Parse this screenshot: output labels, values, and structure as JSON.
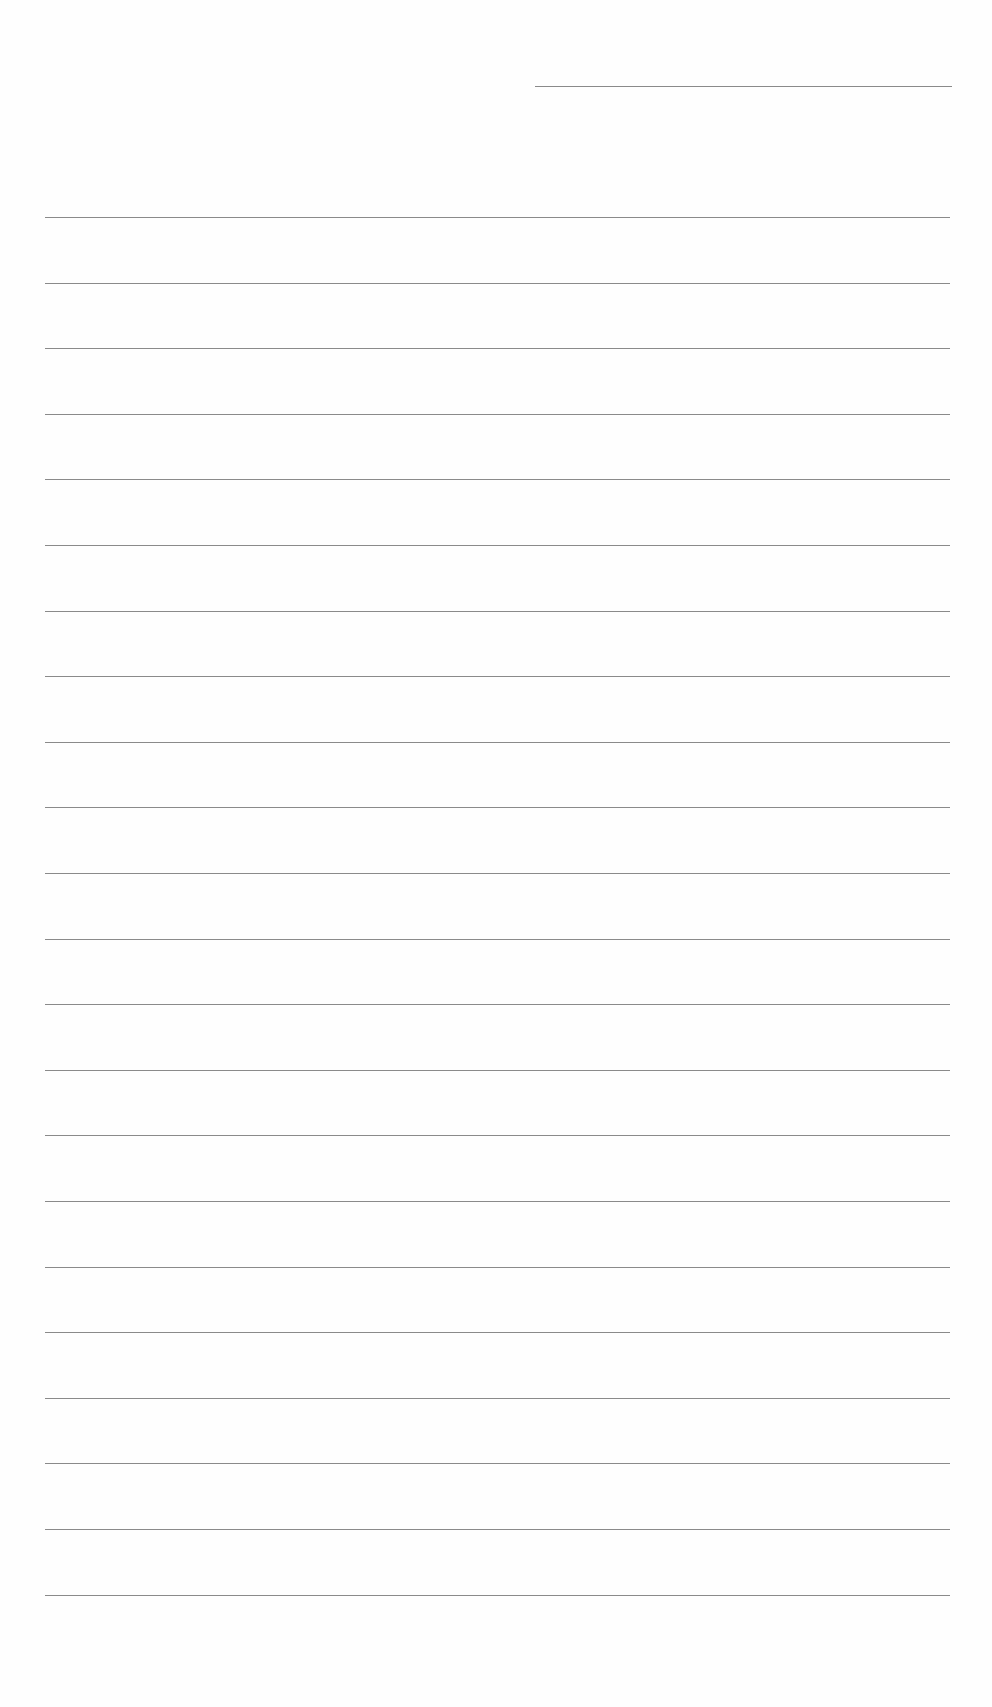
{
  "document": {
    "type": "lined-writing-sheet",
    "header_line": {
      "x_start": 535,
      "x_end": 952,
      "y": 86
    },
    "ruled_lines": {
      "count": 22,
      "x_start": 45,
      "x_end": 950,
      "first_y": 217,
      "spacing": 65.6
    },
    "line_color": "#8a8a8a",
    "background_color": "#fefefe",
    "text": []
  }
}
